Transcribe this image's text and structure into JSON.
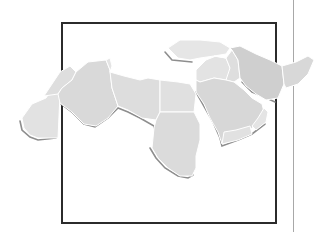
{
  "illustration": {
    "subject": "Map of the Middle East and North Africa",
    "colors": {
      "land": "#dcdcdc",
      "land_light": "#e6e6e6",
      "land_dark": "#cfcfcf",
      "border": "#ffffff",
      "shadow": "#8e8e8e",
      "frame": "#2b2b2b",
      "rule_line": "#a8a8a8",
      "background": "#ffffff"
    }
  }
}
